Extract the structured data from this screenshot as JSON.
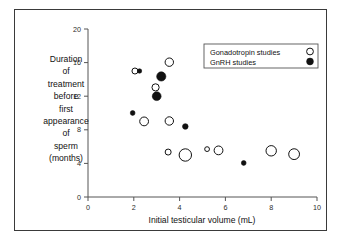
{
  "figure": {
    "border_color": "#3a3a3a",
    "background": "#ffffff"
  },
  "chart_data": {
    "type": "scatter",
    "title": "",
    "xlabel": "Initial testicular volume (mL)",
    "ylabel": "Duration of treatment before first appearance of sperm (months)",
    "ylabel_lines": [
      "Duration",
      "of",
      "treatment",
      "before",
      "first",
      "appearance",
      "of",
      "sperm",
      "(months)"
    ],
    "xlim": [
      0,
      10
    ],
    "ylim": [
      0,
      20
    ],
    "xticks": [
      0,
      2,
      4,
      6,
      8,
      10
    ],
    "yticks": [
      0,
      4,
      8,
      12,
      16,
      20
    ],
    "xtick_labels": [
      "0",
      "2",
      "4",
      "6",
      "8",
      "10"
    ],
    "ytick_labels": [
      "0",
      "4",
      "8",
      "12",
      "16",
      "20"
    ],
    "grid": false,
    "legend_position": "top-right",
    "series": [
      {
        "name": "Gonadotropin studies",
        "marker": "open-circle",
        "color": "#111111",
        "fill": "none",
        "points": [
          {
            "x": 2.05,
            "y": 15.0,
            "size": 3.0
          },
          {
            "x": 3.55,
            "y": 16.05,
            "size": 4.2
          },
          {
            "x": 2.95,
            "y": 13.05,
            "size": 3.6
          },
          {
            "x": 2.45,
            "y": 9.0,
            "size": 4.4
          },
          {
            "x": 3.55,
            "y": 9.05,
            "size": 4.2
          },
          {
            "x": 3.5,
            "y": 5.35,
            "size": 3.0
          },
          {
            "x": 4.25,
            "y": 5.0,
            "size": 6.2
          },
          {
            "x": 5.2,
            "y": 5.7,
            "size": 2.4
          },
          {
            "x": 5.7,
            "y": 5.55,
            "size": 4.4
          },
          {
            "x": 8.0,
            "y": 5.5,
            "size": 5.2
          },
          {
            "x": 9.0,
            "y": 5.1,
            "size": 5.4
          }
        ]
      },
      {
        "name": "GnRH studies",
        "marker": "filled-circle",
        "color": "#111111",
        "fill": "#111111",
        "points": [
          {
            "x": 2.25,
            "y": 15.0,
            "size": 2.2
          },
          {
            "x": 3.2,
            "y": 14.35,
            "size": 4.6
          },
          {
            "x": 3.0,
            "y": 12.0,
            "size": 4.4
          },
          {
            "x": 1.95,
            "y": 10.0,
            "size": 2.4
          },
          {
            "x": 4.25,
            "y": 8.4,
            "size": 2.8
          },
          {
            "x": 6.8,
            "y": 4.05,
            "size": 2.4
          }
        ]
      }
    ]
  },
  "legend": {
    "items": [
      {
        "label": "Gonadotropin studies",
        "marker": "open-circle"
      },
      {
        "label": "GnRH studies",
        "marker": "filled-circle"
      }
    ]
  }
}
